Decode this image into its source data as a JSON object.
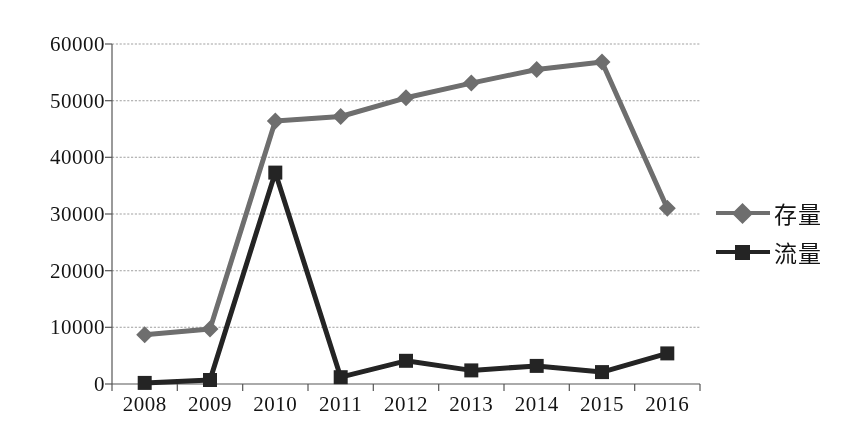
{
  "chart_data": {
    "type": "line",
    "title": "",
    "subtitle": "",
    "xlabel": "",
    "ylabel": "",
    "categories": [
      "2008",
      "2009",
      "2010",
      "2011",
      "2012",
      "2013",
      "2014",
      "2015",
      "2016"
    ],
    "series": [
      {
        "name": "存量",
        "color": "#6e6e6e",
        "marker": "diamond",
        "values": [
          8700,
          9700,
          46400,
          47200,
          50500,
          53100,
          55500,
          56800,
          31000
        ]
      },
      {
        "name": "流量",
        "color": "#262626",
        "marker": "square",
        "values": [
          200,
          700,
          37300,
          1200,
          4100,
          2400,
          3200,
          2100,
          5400
        ]
      }
    ],
    "ylim": [
      0,
      60000
    ],
    "yticks": [
      0,
      10000,
      20000,
      30000,
      40000,
      50000,
      60000
    ],
    "ytick_labels": [
      "0",
      "10000",
      "20000",
      "30000",
      "40000",
      "50000",
      "60000"
    ],
    "grid": true,
    "grid_axis": "y",
    "grid_color": "#9a9a9a",
    "axis_color": "#4a4a4a",
    "legend_position": "right"
  },
  "legend": {
    "entries": [
      {
        "label": "存量"
      },
      {
        "label": "流量"
      }
    ]
  }
}
